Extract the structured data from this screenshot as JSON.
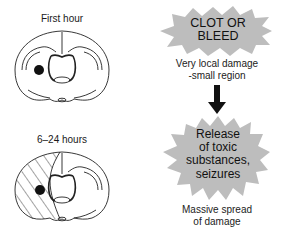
{
  "panels": [
    {
      "time_label": "First hour",
      "lesion": "small-dark-spot"
    },
    {
      "time_label": "6–24 hours",
      "lesion": "dark-spot-with-hatched-spread"
    }
  ],
  "flow": {
    "step1": {
      "title_line1": "CLOT OR",
      "title_line2": "BLEED",
      "caption_line1": "Very local damage",
      "caption_line2": "-small region"
    },
    "arrow": "down-arrow",
    "step2": {
      "title_line1": "Release",
      "title_line2": "of toxic",
      "title_line3": "substances,",
      "title_line4": "seizures",
      "caption_line1": "Massive spread",
      "caption_line2": "of damage"
    }
  },
  "colors": {
    "starburst": "#bdbdbd",
    "ink": "#111111",
    "hatch": "#333333"
  }
}
